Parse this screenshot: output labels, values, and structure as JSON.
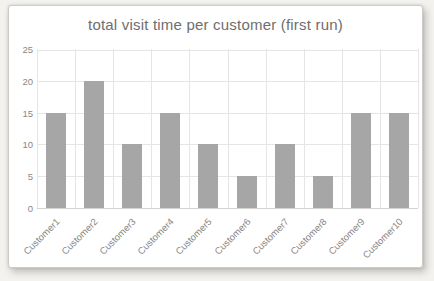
{
  "chart_data": {
    "type": "bar",
    "title": "total visit time per customer (first run)",
    "categories": [
      "Customer1",
      "Customer2",
      "Customer3",
      "Customer4",
      "Customer5",
      "Customer6",
      "Customer7",
      "Customer8",
      "Customer9",
      "Customer10"
    ],
    "values": [
      15,
      20,
      10,
      15,
      10,
      5,
      10,
      5,
      15,
      15
    ],
    "xlabel": "",
    "ylabel": "",
    "ylim": [
      0,
      25
    ],
    "yticks": [
      0,
      5,
      10,
      15,
      20,
      25
    ],
    "grid": "horizontal-and-vertical",
    "legend": "none",
    "colors": {
      "bar": "#a6a6a6",
      "gridline": "#e5e5e5",
      "axis_line": "#d3d3d3",
      "title_text": "#6e6e6e",
      "tick_text": "#878787",
      "card_background": "#ffffff",
      "page_background": "#f3f2ef"
    }
  }
}
